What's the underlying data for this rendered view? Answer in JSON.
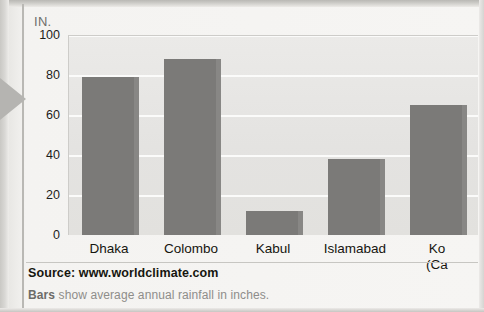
{
  "figure": {
    "y_axis_unit": "IN.",
    "source": "Source: www.worldclimate.com",
    "note_lead": "Bars",
    "note_rest": " show average annual rainfall in inches."
  },
  "chart_data": {
    "type": "bar",
    "title": "",
    "subtitle": "",
    "xlabel": "",
    "ylabel": "IN.",
    "ylim": [
      0,
      100
    ],
    "yticks": [
      0,
      20,
      40,
      60,
      80,
      100
    ],
    "grid": true,
    "legend": null,
    "categories": [
      "Dhaka",
      "Colombo",
      "Kabul",
      "Islamabad",
      "Kolkata (Calcutta)"
    ],
    "category_labels": [
      {
        "line1": "Dhaka",
        "line2": ""
      },
      {
        "line1": "Colombo",
        "line2": ""
      },
      {
        "line1": "Kabul",
        "line2": ""
      },
      {
        "line1": "Islamabad",
        "line2": ""
      },
      {
        "line1": "Ko",
        "line2": "(Ca"
      }
    ],
    "values": [
      79,
      88,
      12,
      38,
      65
    ],
    "bar_color": "#7b7a78",
    "plot_background": "#e6e5e3",
    "note": "rightmost bar and its label are cropped at the right edge of the image"
  }
}
